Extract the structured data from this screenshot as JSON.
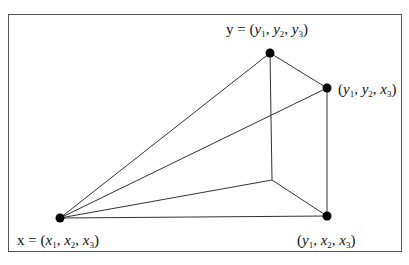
{
  "diagram": {
    "title": "",
    "nodes": [
      {
        "id": "x",
        "label_prefix": "x = ",
        "coords": [
          "x",
          "1",
          "x",
          "2",
          "x",
          "3"
        ]
      },
      {
        "id": "y",
        "label_prefix": "y = ",
        "coords": [
          "y",
          "1",
          "y",
          "2",
          "y",
          "3"
        ]
      },
      {
        "id": "y1y2x3",
        "label_prefix": "",
        "coords": [
          "y",
          "1",
          "y",
          "2",
          "x",
          "3"
        ]
      },
      {
        "id": "y1x2x3",
        "label_prefix": "",
        "coords": [
          "y",
          "1",
          "x",
          "2",
          "x",
          "3"
        ]
      },
      {
        "id": "hidden",
        "label_prefix": "",
        "coords": []
      }
    ],
    "edges": [
      [
        "x",
        "y"
      ],
      [
        "x",
        "y1y2x3"
      ],
      [
        "x",
        "hidden"
      ],
      [
        "x",
        "y1x2x3"
      ],
      [
        "y",
        "y1y2x3"
      ],
      [
        "y",
        "hidden"
      ],
      [
        "y1y2x3",
        "y1x2x3"
      ],
      [
        "hidden",
        "y1x2x3"
      ]
    ],
    "colors": {
      "line": "#333333",
      "node": "#000000",
      "frame": "#555555"
    }
  }
}
